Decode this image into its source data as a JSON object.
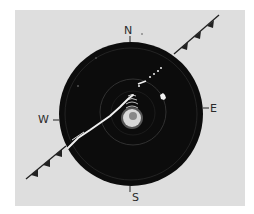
{
  "figure": {
    "compass": {
      "north": "N",
      "south": "S",
      "east": "E",
      "west": "W"
    },
    "colors": {
      "background": "#ffffff",
      "panel": "#dedede",
      "scope": "#0c0c0c",
      "echo": "#f2f2f2",
      "front": "#222222"
    },
    "front_symbol": "cold-front"
  }
}
